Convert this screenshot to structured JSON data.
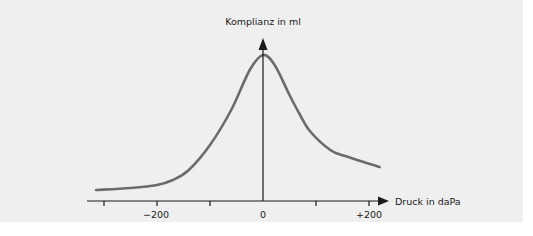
{
  "chart_data": {
    "type": "line",
    "title": "",
    "xlabel": "Druck in daPa",
    "ylabel": "Komplianz in ml",
    "x_ticks": [
      -300,
      -200,
      -100,
      0,
      100,
      200
    ],
    "x_tick_labels": [
      {
        "value": -200,
        "label": "−200"
      },
      {
        "value": 0,
        "label": "0"
      },
      {
        "value": 200,
        "label": "+200"
      }
    ],
    "xlim": [
      -330,
      235
    ],
    "ylim": [
      0,
      160
    ],
    "grid": false,
    "legend": null,
    "series": [
      {
        "name": "Tympanogramm",
        "x": [
          -315,
          -250,
          -200,
          -170,
          -140,
          -100,
          -60,
          -25,
          0,
          22,
          50,
          70,
          90,
          127,
          155,
          220
        ],
        "y": [
          11,
          13,
          16,
          21,
          31,
          56,
          91,
          131,
          146,
          136,
          106,
          86,
          69,
          51,
          45,
          34
        ],
        "note": "y in relative units (no numeric scale shown on y-axis)"
      }
    ],
    "color": "#6b6b6b"
  },
  "axes": {
    "y_label": "Komplianz in ml",
    "x_label": "Druck in daPa",
    "tick_minus_200": "−200",
    "tick_zero": "0",
    "tick_plus_200": "+200"
  }
}
